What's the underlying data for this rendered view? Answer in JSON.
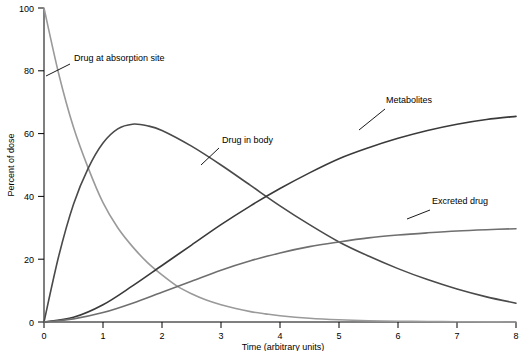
{
  "chart_data": {
    "type": "line",
    "title": "",
    "xlabel": "Time (arbitrary units)",
    "ylabel": "Percent of dose",
    "xlim": [
      0,
      8
    ],
    "ylim": [
      0,
      100
    ],
    "xticks": [
      "0",
      "1",
      "2",
      "3",
      "4",
      "5",
      "6",
      "7",
      "8"
    ],
    "yticks": [
      "0",
      "20",
      "40",
      "60",
      "80",
      "100"
    ],
    "grid": false,
    "legend_position": "inline-annotations",
    "series": [
      {
        "name": "Drug at absorption site",
        "color": "#9a9a9a",
        "x": [
          0,
          0.25,
          0.5,
          0.75,
          1,
          1.25,
          1.5,
          1.75,
          2,
          2.25,
          2.5,
          2.75,
          3,
          3.25,
          3.5,
          3.75,
          4,
          4.5,
          5,
          5.5,
          6,
          6.5,
          7,
          7.5,
          8
        ],
        "values": [
          100,
          79,
          62,
          49,
          38,
          30,
          24,
          19,
          15,
          11.5,
          9,
          7,
          5.5,
          4.3,
          3.3,
          2.6,
          2,
          1.2,
          0.7,
          0.4,
          0.25,
          0.15,
          0.1,
          0.05,
          0
        ]
      },
      {
        "name": "Drug in body",
        "color": "#4a4a4a",
        "x": [
          0,
          0.25,
          0.5,
          0.75,
          1,
          1.25,
          1.5,
          1.75,
          2,
          2.5,
          3,
          3.5,
          4,
          4.5,
          5,
          5.5,
          6,
          6.5,
          7,
          7.5,
          8
        ],
        "values": [
          0,
          21,
          37.5,
          49,
          57,
          61.5,
          63,
          62.5,
          61,
          56,
          50,
          43.5,
          37,
          31,
          25.5,
          21,
          17,
          13.5,
          10.5,
          8,
          6
        ]
      },
      {
        "name": "Metabolites",
        "color": "#3a3a3a",
        "x": [
          0,
          0.5,
          1,
          1.5,
          2,
          2.5,
          3,
          3.5,
          4,
          4.5,
          5,
          5.5,
          6,
          6.5,
          7,
          7.5,
          8
        ],
        "values": [
          0,
          1.5,
          5.5,
          11.5,
          18,
          24.5,
          31,
          37,
          42.5,
          47.5,
          52,
          55.5,
          58.5,
          61,
          63,
          64.5,
          65.5
        ]
      },
      {
        "name": "Excreted drug",
        "color": "#6f6f6f",
        "x": [
          0,
          0.5,
          1,
          1.5,
          2,
          2.5,
          3,
          3.5,
          4,
          4.5,
          5,
          5.5,
          6,
          6.5,
          7,
          7.5,
          8
        ],
        "values": [
          0,
          1,
          3,
          6,
          9.5,
          13,
          16.5,
          19.5,
          22,
          24,
          25.5,
          26.8,
          27.7,
          28.4,
          29,
          29.4,
          29.7
        ]
      }
    ],
    "annotations": [
      {
        "label": "Drug at absorption site",
        "text_x": 74,
        "text_y": 61,
        "leader": [
          [
            70,
            64
          ],
          [
            46,
            76
          ]
        ]
      },
      {
        "label": "Drug in body",
        "text_x": 222,
        "text_y": 143,
        "leader": [
          [
            219,
            148
          ],
          [
            201,
            165
          ]
        ]
      },
      {
        "label": "Metabolites",
        "text_x": 386,
        "text_y": 103,
        "leader": [
          [
            385,
            109
          ],
          [
            359,
            130
          ]
        ]
      },
      {
        "label": "Excreted drug",
        "text_x": 432,
        "text_y": 204,
        "leader": [
          [
            430,
            210
          ],
          [
            407,
            219
          ]
        ]
      }
    ]
  }
}
